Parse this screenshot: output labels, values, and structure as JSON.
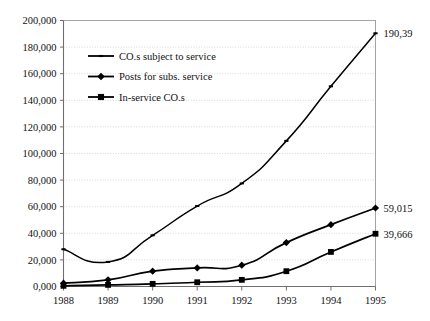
{
  "chart_data": {
    "type": "line",
    "title": "",
    "subtitle": "",
    "xlabel": "",
    "ylabel": "",
    "categories": [
      "1988",
      "1989",
      "1990",
      "1991",
      "1992",
      "1993",
      "1994",
      "1995"
    ],
    "x": [
      1988,
      1989,
      1990,
      1991,
      1992,
      1993,
      1994,
      1995
    ],
    "xlim": [
      1988,
      1995
    ],
    "ylim": [
      0,
      200000
    ],
    "y_ticks": [
      0,
      20000,
      40000,
      60000,
      80000,
      100000,
      120000,
      140000,
      160000,
      180000,
      200000
    ],
    "y_tick_labels": [
      "0,000",
      "20,000",
      "40,000",
      "60,000",
      "80,000",
      "100,000",
      "120,000",
      "140,000",
      "160,000",
      "180,000",
      "200,000"
    ],
    "grid": true,
    "legend_position": "upper-left-inside",
    "series": [
      {
        "name": "CO.s subject to service",
        "marker": "dash",
        "values": [
          28000,
          18500,
          38500,
          60500,
          77500,
          109500,
          150500,
          190390
        ]
      },
      {
        "name": "Posts for subs. service",
        "marker": "diamond",
        "values": [
          2500,
          5000,
          11500,
          14000,
          16000,
          33000,
          46500,
          59015
        ]
      },
      {
        "name": "In-service CO.s",
        "marker": "square",
        "values": [
          500,
          1200,
          2000,
          3200,
          5000,
          11500,
          26000,
          39666
        ]
      }
    ],
    "point_labels": [
      {
        "series": "CO.s subject to service",
        "category": "1995",
        "text": "190,39"
      },
      {
        "series": "Posts for subs. service",
        "category": "1995",
        "text": "59,015"
      },
      {
        "series": "In-service CO.s",
        "category": "1995",
        "text": "39,666"
      }
    ],
    "legend": [
      {
        "label": "CO.s subject to service",
        "marker": "dash"
      },
      {
        "label": "Posts for subs. service",
        "marker": "diamond"
      },
      {
        "label": "In-service CO.s",
        "marker": "square"
      }
    ],
    "colors": {
      "series": "#000000",
      "grid": "#c8c8c8",
      "axis": "#6f6f6f",
      "background": "#ffffff",
      "text": "#111111"
    }
  }
}
